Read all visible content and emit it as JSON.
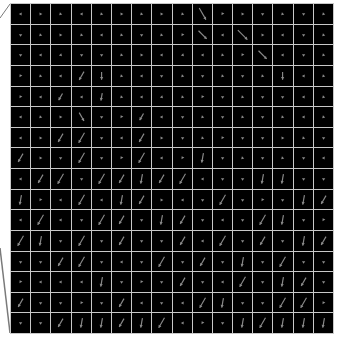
{
  "figure": {
    "rows": 16,
    "cols": 16,
    "background": "#000000",
    "grid_line_color": "#c8c8c8",
    "arrow_color": "#8a8a8a",
    "edge_line_color": "#7a7a7a"
  },
  "field": [
    [
      [
        60,
        4
      ],
      [
        120,
        4
      ],
      [
        135,
        4
      ],
      [
        60,
        4
      ],
      [
        135,
        4
      ],
      [
        120,
        4
      ],
      [
        135,
        4
      ],
      [
        120,
        4
      ],
      [
        135,
        4
      ],
      [
        60,
        14
      ],
      [
        240,
        4
      ],
      [
        120,
        4
      ],
      [
        90,
        4
      ],
      [
        135,
        4
      ],
      [
        90,
        4
      ],
      [
        135,
        4
      ]
    ],
    [
      [
        90,
        4
      ],
      [
        135,
        4
      ],
      [
        120,
        4
      ],
      [
        135,
        4
      ],
      [
        60,
        4
      ],
      [
        135,
        4
      ],
      [
        90,
        4
      ],
      [
        135,
        4
      ],
      [
        240,
        4
      ],
      [
        45,
        12
      ],
      [
        60,
        4
      ],
      [
        45,
        14
      ],
      [
        120,
        4
      ],
      [
        60,
        4
      ],
      [
        90,
        4
      ],
      [
        135,
        4
      ]
    ],
    [
      [
        90,
        4
      ],
      [
        60,
        4
      ],
      [
        45,
        4
      ],
      [
        90,
        4
      ],
      [
        90,
        4
      ],
      [
        135,
        4
      ],
      [
        120,
        4
      ],
      [
        60,
        4
      ],
      [
        45,
        4
      ],
      [
        60,
        4
      ],
      [
        135,
        4
      ],
      [
        240,
        4
      ],
      [
        45,
        12
      ],
      [
        60,
        4
      ],
      [
        90,
        4
      ],
      [
        135,
        4
      ]
    ],
    [
      [
        240,
        4
      ],
      [
        135,
        4
      ],
      [
        60,
        4
      ],
      [
        120,
        10
      ],
      [
        90,
        8
      ],
      [
        135,
        4
      ],
      [
        60,
        4
      ],
      [
        90,
        4
      ],
      [
        135,
        4
      ],
      [
        90,
        4
      ],
      [
        135,
        4
      ],
      [
        90,
        4
      ],
      [
        135,
        4
      ],
      [
        90,
        8
      ],
      [
        60,
        4
      ],
      [
        135,
        4
      ]
    ],
    [
      [
        240,
        4
      ],
      [
        60,
        4
      ],
      [
        120,
        8
      ],
      [
        60,
        4
      ],
      [
        100,
        8
      ],
      [
        135,
        4
      ],
      [
        60,
        4
      ],
      [
        45,
        4
      ],
      [
        135,
        4
      ],
      [
        240,
        4
      ],
      [
        90,
        4
      ],
      [
        135,
        4
      ],
      [
        90,
        4
      ],
      [
        90,
        4
      ],
      [
        60,
        4
      ],
      [
        135,
        4
      ]
    ],
    [
      [
        60,
        4
      ],
      [
        135,
        4
      ],
      [
        120,
        4
      ],
      [
        60,
        10
      ],
      [
        90,
        4
      ],
      [
        240,
        4
      ],
      [
        120,
        8
      ],
      [
        60,
        4
      ],
      [
        90,
        4
      ],
      [
        135,
        4
      ],
      [
        90,
        4
      ],
      [
        135,
        4
      ],
      [
        90,
        4
      ],
      [
        135,
        4
      ],
      [
        60,
        4
      ],
      [
        135,
        4
      ]
    ],
    [
      [
        60,
        4
      ],
      [
        120,
        4
      ],
      [
        120,
        10
      ],
      [
        120,
        12
      ],
      [
        90,
        4
      ],
      [
        60,
        4
      ],
      [
        120,
        10
      ],
      [
        120,
        4
      ],
      [
        90,
        4
      ],
      [
        135,
        4
      ],
      [
        240,
        4
      ],
      [
        90,
        4
      ],
      [
        90,
        4
      ],
      [
        120,
        4
      ],
      [
        135,
        4
      ],
      [
        90,
        4
      ]
    ],
    [
      [
        120,
        10
      ],
      [
        120,
        4
      ],
      [
        90,
        4
      ],
      [
        120,
        12
      ],
      [
        90,
        4
      ],
      [
        240,
        4
      ],
      [
        120,
        12
      ],
      [
        60,
        4
      ],
      [
        240,
        4
      ],
      [
        100,
        10
      ],
      [
        90,
        4
      ],
      [
        135,
        4
      ],
      [
        90,
        4
      ],
      [
        135,
        4
      ],
      [
        90,
        4
      ],
      [
        60,
        4
      ]
    ],
    [
      [
        60,
        4
      ],
      [
        120,
        10
      ],
      [
        120,
        12
      ],
      [
        90,
        4
      ],
      [
        120,
        12
      ],
      [
        120,
        10
      ],
      [
        100,
        10
      ],
      [
        120,
        10
      ],
      [
        120,
        12
      ],
      [
        60,
        4
      ],
      [
        90,
        4
      ],
      [
        90,
        4
      ],
      [
        100,
        10
      ],
      [
        100,
        10
      ],
      [
        90,
        4
      ],
      [
        90,
        4
      ]
    ],
    [
      [
        100,
        10
      ],
      [
        240,
        4
      ],
      [
        60,
        4
      ],
      [
        120,
        12
      ],
      [
        60,
        4
      ],
      [
        100,
        10
      ],
      [
        120,
        10
      ],
      [
        120,
        4
      ],
      [
        60,
        4
      ],
      [
        90,
        4
      ],
      [
        120,
        12
      ],
      [
        90,
        4
      ],
      [
        240,
        4
      ],
      [
        90,
        4
      ],
      [
        100,
        10
      ],
      [
        120,
        10
      ]
    ],
    [
      [
        60,
        4
      ],
      [
        120,
        12
      ],
      [
        60,
        4
      ],
      [
        90,
        4
      ],
      [
        120,
        12
      ],
      [
        120,
        10
      ],
      [
        90,
        4
      ],
      [
        100,
        10
      ],
      [
        120,
        10
      ],
      [
        90,
        4
      ],
      [
        60,
        4
      ],
      [
        90,
        4
      ],
      [
        120,
        12
      ],
      [
        100,
        10
      ],
      [
        90,
        4
      ],
      [
        240,
        4
      ]
    ],
    [
      [
        120,
        12
      ],
      [
        100,
        10
      ],
      [
        90,
        4
      ],
      [
        120,
        12
      ],
      [
        90,
        4
      ],
      [
        120,
        10
      ],
      [
        90,
        4
      ],
      [
        90,
        4
      ],
      [
        120,
        10
      ],
      [
        60,
        4
      ],
      [
        120,
        12
      ],
      [
        90,
        4
      ],
      [
        120,
        10
      ],
      [
        90,
        4
      ],
      [
        100,
        10
      ],
      [
        120,
        10
      ]
    ],
    [
      [
        90,
        4
      ],
      [
        90,
        4
      ],
      [
        120,
        10
      ],
      [
        120,
        12
      ],
      [
        90,
        4
      ],
      [
        60,
        4
      ],
      [
        90,
        4
      ],
      [
        120,
        12
      ],
      [
        90,
        4
      ],
      [
        120,
        10
      ],
      [
        90,
        4
      ],
      [
        100,
        10
      ],
      [
        90,
        4
      ],
      [
        120,
        12
      ],
      [
        90,
        4
      ],
      [
        90,
        4
      ]
    ],
    [
      [
        240,
        4
      ],
      [
        60,
        4
      ],
      [
        60,
        4
      ],
      [
        60,
        4
      ],
      [
        100,
        10
      ],
      [
        90,
        4
      ],
      [
        240,
        4
      ],
      [
        90,
        4
      ],
      [
        120,
        10
      ],
      [
        90,
        4
      ],
      [
        60,
        4
      ],
      [
        120,
        12
      ],
      [
        90,
        4
      ],
      [
        100,
        10
      ],
      [
        120,
        10
      ],
      [
        90,
        4
      ]
    ],
    [
      [
        120,
        10
      ],
      [
        90,
        4
      ],
      [
        90,
        4
      ],
      [
        240,
        4
      ],
      [
        90,
        4
      ],
      [
        120,
        10
      ],
      [
        60,
        4
      ],
      [
        90,
        4
      ],
      [
        60,
        4
      ],
      [
        120,
        12
      ],
      [
        100,
        10
      ],
      [
        90,
        4
      ],
      [
        90,
        4
      ],
      [
        120,
        12
      ],
      [
        120,
        12
      ],
      [
        240,
        4
      ]
    ],
    [
      [
        90,
        4
      ],
      [
        90,
        4
      ],
      [
        120,
        10
      ],
      [
        100,
        10
      ],
      [
        100,
        10
      ],
      [
        120,
        10
      ],
      [
        100,
        10
      ],
      [
        120,
        12
      ],
      [
        60,
        4
      ],
      [
        240,
        4
      ],
      [
        90,
        4
      ],
      [
        100,
        10
      ],
      [
        120,
        12
      ],
      [
        100,
        10
      ],
      [
        100,
        10
      ],
      [
        100,
        10
      ]
    ]
  ]
}
